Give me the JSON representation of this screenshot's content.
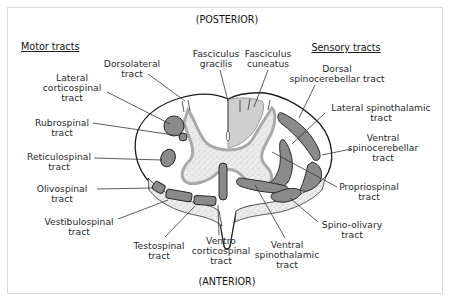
{
  "orientation": {
    "top": "(POSTERIOR)",
    "bottom": "(ANTERIOR)"
  },
  "headers": {
    "motor": "Motor tracts",
    "sensory": "Sensory tracts"
  },
  "labels": {
    "dorsolateral": [
      "Dorsolateral",
      "tract"
    ],
    "lateral_corticospinal": [
      "Lateral",
      "corticospinal",
      "tract"
    ],
    "rubrospinal": [
      "Rubrospinal",
      "tract"
    ],
    "reticulospinal": [
      "Reticulospinal",
      "tract"
    ],
    "olivospinal": [
      "Olivospinal",
      "tract"
    ],
    "vestibulospinal": [
      "Vestibulospinal",
      "tract"
    ],
    "testospinal": [
      "Testospinal",
      "tract"
    ],
    "ventro_corticospinal": [
      "Ventro",
      "corticospinal",
      "tract"
    ],
    "ventral_spinothalamic": [
      "Ventral",
      "spinothalamic",
      "tract"
    ],
    "spino_olivary": [
      "Spino-olivary",
      "tract"
    ],
    "propriospinal": [
      "Propriospinal",
      "tract"
    ],
    "ventral_spinocerebellar": [
      "Ventral",
      "spinocerebellar",
      "tract"
    ],
    "lateral_spinothalamic": [
      "Lateral spinothalamic",
      "tract"
    ],
    "dorsal_spinocerebellar": [
      "Dorsal",
      "spinocerebellar tract"
    ],
    "fasciculus_cuneatus": [
      "Fasciculus",
      "cuneatus"
    ],
    "fasciculus_gracilis": [
      "Fasciculus",
      "gracilis"
    ]
  },
  "colors": {
    "tract_fill": "#8a8a8a",
    "grey_matter_fill": "#e6e6e6",
    "grey_matter_border": "#a9a9a9",
    "dorsal_column_fill": "#cfcfcf",
    "outline": "#2a2a2a"
  }
}
